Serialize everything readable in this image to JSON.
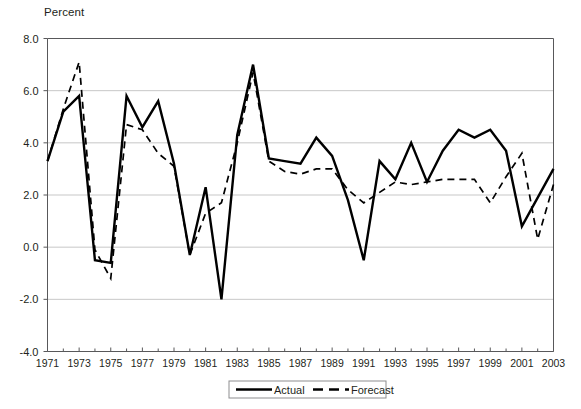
{
  "axis_unit_label": "Percent",
  "legend": {
    "actual_label": "Actual",
    "forecast_label": "Forecast"
  },
  "colors": {
    "line": "#000000",
    "grid": "#b9b9b9",
    "frame": "#58585a",
    "text": "#231f20",
    "background": "#ffffff"
  },
  "chart_data": {
    "type": "line",
    "title": "",
    "subtitle": "",
    "xlabel": "",
    "ylabel": "Percent",
    "ylim": [
      -4.0,
      8.0
    ],
    "xlim": [
      1971,
      2003
    ],
    "grid": true,
    "legend_position": "bottom-center",
    "ytick_labels": [
      "8.0",
      "6.0",
      "4.0",
      "2.0",
      "0.0",
      "-2.0",
      "-4.0"
    ],
    "yticks": [
      8.0,
      6.0,
      4.0,
      2.0,
      0.0,
      -2.0,
      -4.0
    ],
    "xtick_labels": [
      "1971",
      "1973",
      "1975",
      "1977",
      "1979",
      "1981",
      "1983",
      "1985",
      "1987",
      "1989",
      "1991",
      "1993",
      "1995",
      "1997",
      "1999",
      "2001",
      "2003"
    ],
    "xticks": [
      1971,
      1973,
      1975,
      1977,
      1979,
      1981,
      1983,
      1985,
      1987,
      1989,
      1991,
      1993,
      1995,
      1997,
      1999,
      2001,
      2003
    ],
    "x": [
      1971,
      1972,
      1973,
      1974,
      1975,
      1976,
      1977,
      1978,
      1979,
      1980,
      1981,
      1982,
      1983,
      1984,
      1985,
      1986,
      1987,
      1988,
      1989,
      1990,
      1991,
      1992,
      1993,
      1994,
      1995,
      1996,
      1997,
      1998,
      1999,
      2000,
      2001,
      2002,
      2003
    ],
    "series": [
      {
        "name": "Actual",
        "style": "solid",
        "values": [
          3.3,
          5.2,
          5.8,
          -0.5,
          -0.6,
          5.8,
          4.6,
          5.6,
          3.2,
          -0.3,
          2.3,
          -2.0,
          4.3,
          7.0,
          3.4,
          3.3,
          3.2,
          4.2,
          3.5,
          1.8,
          -0.5,
          3.3,
          2.6,
          4.0,
          2.5,
          3.7,
          4.5,
          4.2,
          4.5,
          3.7,
          0.8,
          1.9,
          3.0
        ]
      },
      {
        "name": "Forecast",
        "style": "dashed",
        "values": [
          3.3,
          5.3,
          7.1,
          -0.1,
          -1.2,
          4.7,
          4.5,
          3.6,
          3.1,
          -0.3,
          1.3,
          1.7,
          4.0,
          6.7,
          3.3,
          2.9,
          2.8,
          3.0,
          3.0,
          2.2,
          1.7,
          2.1,
          2.5,
          2.4,
          2.5,
          2.6,
          2.6,
          2.6,
          1.7,
          2.7,
          3.6,
          0.3,
          2.4
        ]
      }
    ]
  }
}
